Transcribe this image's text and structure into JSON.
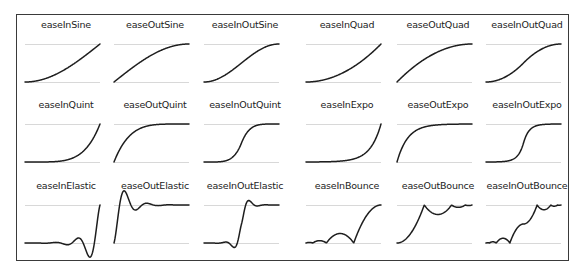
{
  "chart_data": {
    "type": "line",
    "title": "",
    "layout": {
      "rows": 3,
      "cols": 6,
      "grid": false,
      "legend": "none"
    },
    "axes": {
      "x_range": [
        0,
        1
      ],
      "y_guides": [
        0,
        1
      ]
    },
    "panels": [
      {
        "name": "easeInSine",
        "fn": "easeInSine"
      },
      {
        "name": "easeOutSine",
        "fn": "easeOutSine"
      },
      {
        "name": "easeInOutSine",
        "fn": "easeInOutSine"
      },
      {
        "name": "easeInQuad",
        "fn": "easeInQuad"
      },
      {
        "name": "easeOutQuad",
        "fn": "easeOutQuad"
      },
      {
        "name": "easeInOutQuad",
        "fn": "easeInOutQuad"
      },
      {
        "name": "easeInQuint",
        "fn": "easeInQuint"
      },
      {
        "name": "easeOutQuint",
        "fn": "easeOutQuint"
      },
      {
        "name": "easeInOutQuint",
        "fn": "easeInOutQuint"
      },
      {
        "name": "easeInExpo",
        "fn": "easeInExpo"
      },
      {
        "name": "easeOutExpo",
        "fn": "easeOutExpo"
      },
      {
        "name": "easeInOutExpo",
        "fn": "easeInOutExpo"
      },
      {
        "name": "easeInElastic",
        "fn": "easeInElastic"
      },
      {
        "name": "easeOutElastic",
        "fn": "easeOutElastic"
      },
      {
        "name": "easeInOutElastic",
        "fn": "easeInOutElastic"
      },
      {
        "name": "easeInBounce",
        "fn": "easeInBounce"
      },
      {
        "name": "easeOutBounce",
        "fn": "easeOutBounce"
      },
      {
        "name": "easeInOutBounce",
        "fn": "easeInOutBounce"
      }
    ]
  },
  "colors": {
    "curve": "#1e1e1e",
    "guide": "#d8d8d8",
    "frame": "#3a3a3a"
  }
}
